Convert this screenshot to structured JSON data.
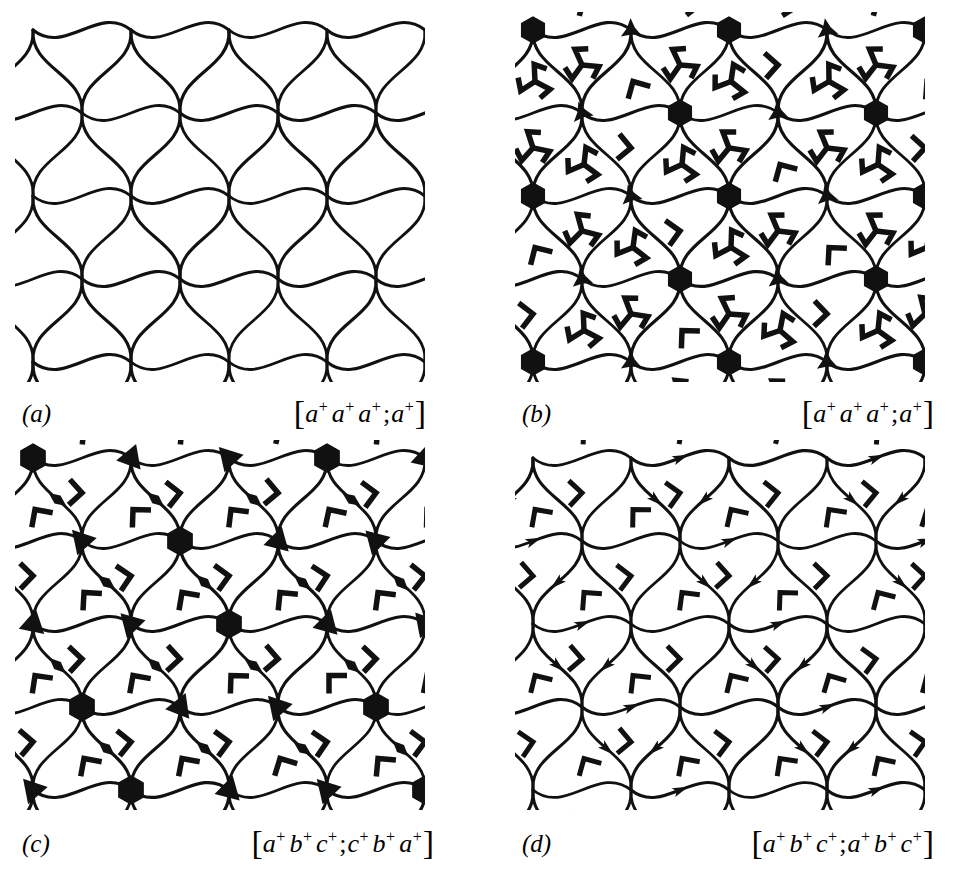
{
  "figure": {
    "background": "#ffffff",
    "ink": "#111111",
    "line_width": 3.0,
    "panel_size": [
      410,
      370
    ],
    "lattice": {
      "dx": 98,
      "dy": 83,
      "row_shift": 49
    }
  },
  "panels": [
    {
      "id": "a",
      "label": "(a)",
      "expression_parts": [
        "a",
        "+",
        "a",
        "+",
        "a",
        "+",
        ";",
        "a",
        "+"
      ],
      "expression_text": "[a+a+a+; a+]",
      "origin": [
        15,
        12
      ],
      "features": {
        "curves": true,
        "hexagon_nodes": false,
        "star_nodes": false,
        "triangle_nodes": false,
        "triskelions": false,
        "lens_marks": false,
        "brackets": false,
        "arrowheads": false
      }
    },
    {
      "id": "b",
      "label": "(b)",
      "expression_parts": [
        "a",
        "+",
        "a",
        "+",
        "a",
        "+",
        ";",
        "a",
        "+"
      ],
      "expression_text": "[a+a+a+; a+]",
      "origin": [
        515,
        12
      ],
      "features": {
        "curves": true,
        "hexagon_nodes": true,
        "star_nodes": true,
        "triangle_nodes": false,
        "triskelions": true,
        "lens_marks": false,
        "brackets": true,
        "arrowheads": false
      }
    },
    {
      "id": "c",
      "label": "(c)",
      "expression_parts": [
        "a",
        "+",
        "b",
        "+",
        "c",
        "+",
        ";",
        "c",
        "+",
        "b",
        "+",
        "a",
        "+"
      ],
      "expression_text": "[a+b+c+;c+b+a+]",
      "origin": [
        15,
        440
      ],
      "features": {
        "curves": true,
        "hexagon_nodes": true,
        "star_nodes": false,
        "triangle_nodes": true,
        "triskelions": false,
        "lens_marks": true,
        "brackets": true,
        "arrowheads": false
      }
    },
    {
      "id": "d",
      "label": "(d)",
      "expression_parts": [
        "a",
        "+",
        "b",
        "+",
        "c",
        "+",
        ";",
        "a",
        "+",
        "b",
        "+",
        "c",
        "+"
      ],
      "expression_text": "[a+b+c+;a+b+c+]",
      "origin": [
        515,
        440
      ],
      "features": {
        "curves": true,
        "hexagon_nodes": false,
        "star_nodes": false,
        "triangle_nodes": false,
        "triskelions": false,
        "lens_marks": false,
        "brackets": true,
        "arrowheads": true
      }
    }
  ],
  "captions": [
    {
      "letter": "(a)",
      "x": 22,
      "y": 392,
      "width": 404
    },
    {
      "letter": "(b)",
      "x": 522,
      "y": 392,
      "width": 412
    },
    {
      "letter": "(c)",
      "x": 22,
      "y": 822,
      "width": 412
    },
    {
      "letter": "(d)",
      "x": 522,
      "y": 822,
      "width": 412
    }
  ]
}
